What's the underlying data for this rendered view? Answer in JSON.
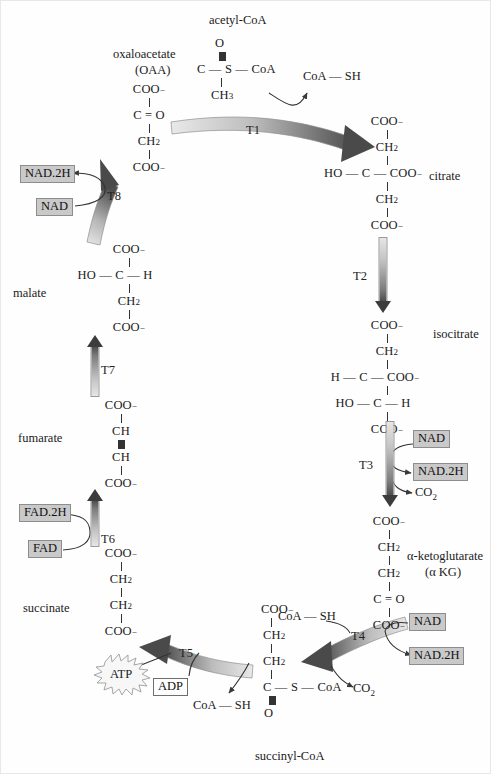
{
  "diagram": {
    "colors": {
      "chip_fill": "#c9c9c9",
      "chip_border": "#8d8d8d",
      "arrow_dark": "#3c3c3c",
      "arrow_light": "#e6e6e6",
      "text": "#1a1a1a",
      "background": "#ffffff"
    }
  },
  "metabolites": {
    "acetyl_coa": {
      "name": "acetyl-CoA",
      "lines": [
        "O",
        "‖",
        "C — S — CoA",
        "|",
        "CH3"
      ]
    },
    "oxaloacetate": {
      "name": "oxaloacetate",
      "abbrev": "(OAA)",
      "lines": [
        "COO⁻",
        "|",
        "C = O",
        "|",
        "CH2",
        "|",
        "COO⁻"
      ]
    },
    "citrate": {
      "name": "citrate",
      "lines": [
        "COO⁻",
        "|",
        "CH2",
        "|",
        "HO — C — COO⁻",
        "|",
        "CH2",
        "|",
        "COO⁻"
      ]
    },
    "isocitrate": {
      "name": "isocitrate",
      "lines": [
        "COO⁻",
        "|",
        "CH2",
        "|",
        "H — C — COO⁻",
        "|",
        "HO — C — H",
        "|",
        "COO⁻"
      ]
    },
    "alpha_ketoglutarate": {
      "name": "α-ketoglutarate",
      "abbrev": "(α KG)",
      "lines": [
        "COO⁻",
        "|",
        "CH2",
        "|",
        "CH2",
        "|",
        "C = O",
        "|",
        "COO⁻"
      ]
    },
    "succinyl_coa": {
      "name": "succinyl-CoA",
      "lines": [
        "COO⁻",
        "|",
        "CH2",
        "|",
        "CH2",
        "|",
        "C — S — CoA",
        "‖",
        "O"
      ]
    },
    "succinate": {
      "name": "succinate",
      "lines": [
        "COO⁻",
        "|",
        "CH2",
        "|",
        "CH2",
        "|",
        "COO⁻"
      ]
    },
    "fumarate": {
      "name": "fumarate",
      "lines": [
        "COO⁻",
        "|",
        "CH",
        "‖",
        "CH",
        "|",
        "COO⁻"
      ]
    },
    "malate": {
      "name": "malate",
      "lines": [
        "COO⁻",
        "|",
        "HO — C — H",
        "|",
        "CH2",
        "|",
        "COO⁻"
      ]
    }
  },
  "steps": [
    {
      "id": "T1",
      "label": "T1"
    },
    {
      "id": "T2",
      "label": "T2"
    },
    {
      "id": "T3",
      "label": "T3"
    },
    {
      "id": "T4",
      "label": "T4"
    },
    {
      "id": "T5",
      "label": "T5"
    },
    {
      "id": "T6",
      "label": "T6"
    },
    {
      "id": "T7",
      "label": "T7"
    },
    {
      "id": "T8",
      "label": "T8"
    }
  ],
  "cofactors": {
    "t1_coash_out": "CoA — SH",
    "t3_nad_in": "NAD",
    "t3_nadh_out": "NAD.2H",
    "t3_co2_out": "CO2",
    "t4_coash_in": "CoA — SH",
    "t4_nad_in": "NAD",
    "t4_nadh_out": "NAD.2H",
    "t4_co2_out": "CO2",
    "t5_adp_in": "ADP",
    "t5_atp_out": "ATP",
    "t5_coash_out": "CoA — SH",
    "t6_fad_in": "FAD",
    "t6_fadh_out": "FAD.2H",
    "t8_nad_in": "NAD",
    "t8_nadh_out": "NAD.2H"
  }
}
